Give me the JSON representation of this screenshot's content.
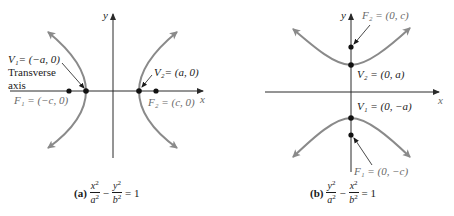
{
  "colors": {
    "curve": "#8a8a8a",
    "axis": "#2a2a2a",
    "point": "#111111",
    "label": "#1a1a1a",
    "label_gray": "#6a6a6a"
  },
  "panel_a": {
    "caption_tag": "(a)",
    "equation": {
      "t1_num": "x",
      "t1_den": "a",
      "t2_num": "y",
      "t2_den": "b",
      "minus": "−",
      "rhs": "= 1"
    },
    "axis_x": "x",
    "axis_y": "y",
    "v1": "V₁= (−a, 0)",
    "v2": "V₂= (a, 0)",
    "f1": "F₁ = (−c, 0)",
    "f2": "F₂ = (c, 0)",
    "transverse_line1": "Transverse",
    "transverse_line2": "axis"
  },
  "panel_b": {
    "caption_tag": "(b)",
    "equation": {
      "t1_num": "y",
      "t1_den": "a",
      "t2_num": "x",
      "t2_den": "b",
      "minus": "−",
      "rhs": "= 1"
    },
    "axis_x": "x",
    "axis_y": "y",
    "f2": "F₂ = (0, c)",
    "v2": "V₂ = (0, a)",
    "v1": "V₁ = (0, −a)",
    "f1": "F₁ = (0, −c)"
  }
}
